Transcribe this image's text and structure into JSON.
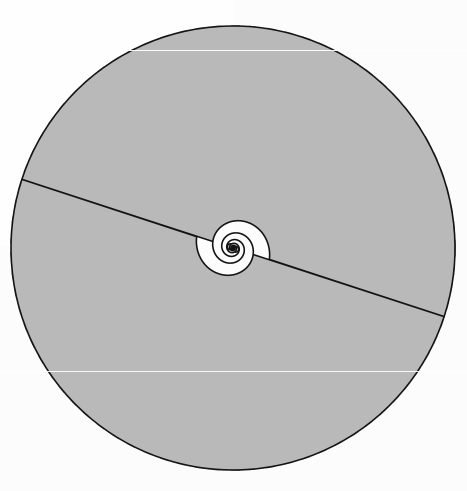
{
  "figure": {
    "kind": "geometric-diagram",
    "canvas": {
      "width": 467,
      "height": 491
    },
    "background_color": "#fcfcfc",
    "paper_texture": true
  },
  "chart_data": {
    "type": "scatter",
    "subtitle": "",
    "xlabel": "",
    "ylabel": "",
    "grid": false,
    "legend_position": "none",
    "xlim": [
      0,
      467
    ],
    "ylim": [
      0,
      491
    ],
    "annotations": [],
    "series": [
      {
        "name": "outer-reference-circle",
        "role": "dashed bounding circle",
        "shape": "circle",
        "center": [
          233,
          248
        ],
        "radius": 222,
        "stroke": "#1a1a1a",
        "stroke_width": 1.6,
        "dash_pattern": [
          9,
          9
        ],
        "fill": "none"
      },
      {
        "name": "spiral-arm-a",
        "role": "shaded logarithmic spiral band (primary)",
        "shape": "logarithmic-spiral-band",
        "center": [
          233,
          248
        ],
        "start_angle_deg": 0,
        "a": 1.05,
        "b": 0.1875,
        "turns": 3.05,
        "fill": "#b9b9b9",
        "stroke": "#141414",
        "stroke_width": 1.6
      },
      {
        "name": "spiral-arm-b",
        "role": "shaded logarithmic spiral band (180 deg offset)",
        "shape": "logarithmic-spiral-band",
        "center": [
          233,
          248
        ],
        "start_angle_deg": 180,
        "a": 1.05,
        "b": 0.1875,
        "turns": 3.05,
        "fill": "#b9b9b9",
        "stroke": "#141414",
        "stroke_width": 1.6
      }
    ],
    "measurements": {
      "center_x": 233,
      "center_y": 248,
      "circle_radius": 222,
      "spiral_top_y": 20,
      "spiral_bottom_y": 466,
      "spiral_left_tip": [
        22,
        253
      ],
      "spiral_right_tip": [
        446,
        266
      ],
      "growth_per_turn": 3.25,
      "arm_count": 2,
      "arm_offset_deg": 180
    }
  },
  "colors": {
    "band_fill": "#b9b9b9",
    "outline": "#141414",
    "dash": "#1a1a1a",
    "background": "#fcfcfc",
    "gap_fill": "#fdfdfd"
  },
  "artifacts": {
    "scanlines": [
      {
        "name": "upper-scanline",
        "y": 50
      },
      {
        "name": "lower-scanline",
        "y": 371
      }
    ]
  }
}
